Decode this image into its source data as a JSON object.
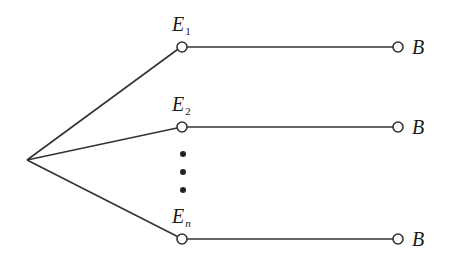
{
  "diagram": {
    "type": "tree",
    "stroke_color": "#333333",
    "root": {
      "x": 27,
      "y": 160
    },
    "branches": [
      {
        "label_main": "E",
        "label_sub": "1",
        "node": {
          "x": 182,
          "y": 47
        },
        "end": {
          "x": 398,
          "y": 47
        },
        "end_label": "B",
        "label_x": 173,
        "label_y": 14
      },
      {
        "label_main": "E",
        "label_sub": "2",
        "node": {
          "x": 182,
          "y": 127
        },
        "end": {
          "x": 398,
          "y": 127
        },
        "end_label": "B",
        "label_x": 173,
        "label_y": 94
      },
      {
        "label_main": "E",
        "label_sub": "n",
        "node": {
          "x": 182,
          "y": 239
        },
        "end": {
          "x": 398,
          "y": 239
        },
        "end_label": "B",
        "label_x": 173,
        "label_y": 206
      }
    ],
    "ellipsis_dots": [
      {
        "x": 183,
        "y": 154
      },
      {
        "x": 183,
        "y": 172
      },
      {
        "x": 183,
        "y": 190
      }
    ]
  },
  "labels": {
    "e1_main": "E",
    "e1_sub": "1",
    "e2_main": "E",
    "e2_sub": "2",
    "en_main": "E",
    "en_sub": "n",
    "b1": "B",
    "b2": "B",
    "b3": "B"
  }
}
